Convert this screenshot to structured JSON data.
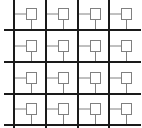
{
  "diagram": {
    "type": "grid-network",
    "rows": 4,
    "columns": 4,
    "node_shape": "square",
    "colors": {
      "background": "#ffffff",
      "grid_line": "#1a1a1a",
      "node_stroke": "#808080",
      "connector": "#808080"
    },
    "vertical_lines_x": [
      14,
      46,
      78,
      109
    ],
    "horizontal_lines_y": [
      30,
      62,
      94,
      125
    ],
    "node_offset": {
      "dx": 12,
      "dy": -22,
      "size": 11
    },
    "connector_y_offset": -16
  }
}
